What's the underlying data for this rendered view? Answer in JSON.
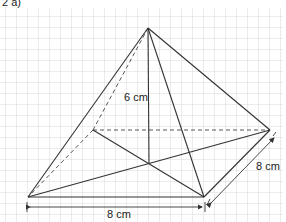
{
  "header": {
    "label": "2  a)"
  },
  "figure": {
    "type": "square-based pyramid",
    "height_label": "6 cm",
    "base_width_label": "8 cm",
    "base_depth_label": "8 cm"
  },
  "colors": {
    "grid": "#c8c8c8",
    "lines": "#333333"
  }
}
